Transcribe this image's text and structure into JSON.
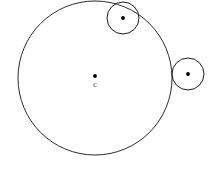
{
  "figure": {
    "background_color": "#ffffff",
    "stroke_color": "#1a1a1a",
    "dot_color": "#000000",
    "label_color": "#4a4a4a",
    "width": 219,
    "height": 169
  },
  "chart_data": {
    "type": "scatter",
    "subtitle": "",
    "xlabel": "",
    "ylabel": "",
    "xlim": [
      0,
      219
    ],
    "ylim": [
      0,
      169
    ],
    "grid": false,
    "legend": "none",
    "annotations": [
      {
        "name": "center-label-c",
        "text": "c",
        "x": 95,
        "y": 87
      }
    ],
    "shapes": [
      {
        "name": "large-circle",
        "kind": "circle",
        "cx": 95,
        "cy": 78,
        "r": 77,
        "fill": "none",
        "stroke": "#2b2b2b",
        "stroke_width": 1,
        "label": "Large circle centered at c"
      },
      {
        "name": "small-circle-top",
        "kind": "circle",
        "cx": 123,
        "cy": 18,
        "r": 16,
        "fill": "none",
        "stroke": "#1a1a1a",
        "stroke_width": 1,
        "label": "Small circle tangent near top of large circle"
      },
      {
        "name": "small-circle-right",
        "kind": "circle",
        "cx": 188,
        "cy": 74,
        "r": 16,
        "fill": "none",
        "stroke": "#1a1a1a",
        "stroke_width": 1,
        "label": "Small circle externally tangent at right of large circle"
      }
    ],
    "points": [
      {
        "name": "large-circle-center-dot",
        "x": 95,
        "y": 76,
        "r": 1.9,
        "color": "#000000",
        "label": "c"
      },
      {
        "name": "small-circle-top-center-dot",
        "x": 123,
        "y": 18,
        "r": 1.9,
        "color": "#000000",
        "label": ""
      },
      {
        "name": "small-circle-right-center-dot",
        "x": 188,
        "y": 74,
        "r": 1.9,
        "color": "#000000",
        "label": ""
      }
    ]
  }
}
